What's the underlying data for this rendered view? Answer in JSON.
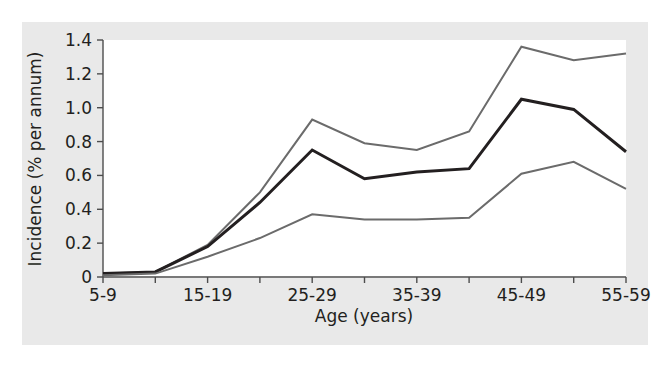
{
  "figure": {
    "background_color": "#e9e9e9",
    "plot_background_color": "#ffffff",
    "axis_color": "#4d4d4d"
  },
  "chart_data": {
    "type": "line",
    "title": "",
    "subtitle": "",
    "xlabel": "Age (years)",
    "ylabel": "Incidence (% per annum)",
    "categories": [
      "5-9",
      "10-14",
      "15-19",
      "20-24",
      "25-29",
      "30-34",
      "35-39",
      "40-44",
      "45-49",
      "50-54",
      "55-59"
    ],
    "x_tick_labels": [
      "5-9",
      "",
      "15-19",
      "",
      "25-29",
      "",
      "35-39",
      "",
      "45-49",
      "",
      "55-59"
    ],
    "y_tick_labels": [
      "0",
      "0.2",
      "0.4",
      "0.6",
      "0.8",
      "1.0",
      "1.2",
      "1.4"
    ],
    "y_tick_values": [
      0,
      0.2,
      0.4,
      0.6,
      0.8,
      1.0,
      1.2,
      1.4
    ],
    "ylim": [
      0,
      1.4
    ],
    "grid": false,
    "legend_position": "none",
    "series": [
      {
        "name": "upper-confidence-limit",
        "color": "#6b6b6b",
        "stroke_width": 2.0,
        "values": [
          0.02,
          0.03,
          0.19,
          0.5,
          0.93,
          0.79,
          0.75,
          0.86,
          1.36,
          1.28,
          1.32
        ]
      },
      {
        "name": "central-estimate",
        "color": "#231f20",
        "stroke_width": 3.0,
        "values": [
          0.02,
          0.03,
          0.18,
          0.44,
          0.75,
          0.58,
          0.62,
          0.64,
          1.05,
          0.99,
          0.74
        ]
      },
      {
        "name": "lower-confidence-limit",
        "color": "#6b6b6b",
        "stroke_width": 2.0,
        "values": [
          0.01,
          0.02,
          0.12,
          0.23,
          0.37,
          0.34,
          0.34,
          0.35,
          0.61,
          0.68,
          0.52
        ]
      }
    ]
  }
}
